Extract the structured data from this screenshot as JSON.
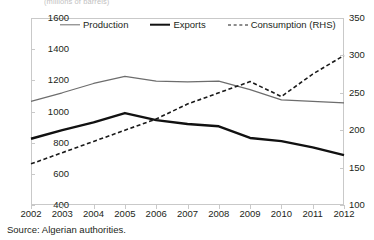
{
  "figure": {
    "title": "(millions of barrels)",
    "source": "Source: Algerian authorities."
  },
  "legend": {
    "items": [
      {
        "label": "Production",
        "style": "thin-solid-gray",
        "color": "#6d6d6d"
      },
      {
        "label": "Exports",
        "style": "thick-solid-black",
        "color": "#111111"
      },
      {
        "label": "Consumption (RHS)",
        "style": "dashed-black",
        "color": "#1a1a1a"
      }
    ]
  },
  "axes": {
    "left": {
      "ticks": [
        "1600",
        "1400",
        "1200",
        "1000",
        "800",
        "600",
        "400"
      ],
      "min": 400,
      "max": 1600,
      "step": 200
    },
    "right": {
      "ticks": [
        "350",
        "300",
        "250",
        "200",
        "150",
        "100"
      ],
      "min": 100,
      "max": 350,
      "step": 50
    },
    "x": {
      "ticks": [
        "2002",
        "2003",
        "2004",
        "2005",
        "2006",
        "2007",
        "2008",
        "2009",
        "2010",
        "2011",
        "2012"
      ]
    }
  },
  "chart_data": {
    "type": "line",
    "title": "(millions of barrels)",
    "xlabel": "",
    "ylabel": "",
    "ylim": [
      400,
      1600
    ],
    "y2lim": [
      100,
      350
    ],
    "grid": false,
    "legend_position": "top-inside",
    "x": [
      2002,
      2003,
      2004,
      2005,
      2006,
      2007,
      2008,
      2009,
      2010,
      2011,
      2012
    ],
    "categories": [
      "2002",
      "2003",
      "2004",
      "2005",
      "2006",
      "2007",
      "2008",
      "2009",
      "2010",
      "2011",
      "2012"
    ],
    "series": [
      {
        "name": "Production",
        "axis": "left",
        "style": "solid",
        "color": "#6d6d6d",
        "values": [
          1065,
          1120,
          1180,
          1225,
          1195,
          1190,
          1195,
          1140,
          1075,
          1065,
          1055
        ]
      },
      {
        "name": "Exports",
        "axis": "left",
        "style": "solid",
        "color": "#111111",
        "values": [
          825,
          880,
          930,
          990,
          945,
          920,
          905,
          830,
          810,
          770,
          720
        ]
      },
      {
        "name": "Consumption (RHS)",
        "axis": "right",
        "style": "dashed",
        "color": "#1a1a1a",
        "values": [
          155,
          170,
          185,
          200,
          215,
          235,
          250,
          265,
          245,
          275,
          300
        ]
      }
    ],
    "annotations": [
      "Source: Algerian authorities."
    ]
  }
}
